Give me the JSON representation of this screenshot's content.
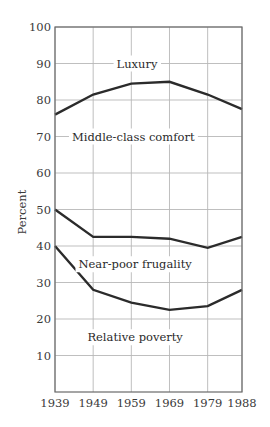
{
  "chart_data": {
    "type": "line",
    "title": "",
    "xlabel": "",
    "ylabel": "Percent",
    "x": [
      1939,
      1949,
      1959,
      1969,
      1979,
      1988
    ],
    "x_tick_labels": [
      "1939",
      "1949",
      "1959",
      "1969",
      "1979",
      "1988"
    ],
    "ylim": [
      0,
      100
    ],
    "y_ticks": [
      10,
      20,
      30,
      40,
      50,
      60,
      70,
      80,
      90,
      100
    ],
    "y_tick_labels": [
      "10",
      "20",
      "30",
      "40",
      "50",
      "60",
      "70",
      "80",
      "90",
      "100"
    ],
    "grid": true,
    "series": [
      {
        "name": "Middle-class comfort / Luxury boundary",
        "values": [
          76,
          81.5,
          84.5,
          85,
          81.5,
          77.5
        ]
      },
      {
        "name": "Near-poor frugality / Middle-class comfort boundary",
        "values": [
          50,
          42.5,
          42.5,
          42,
          39.5,
          42.5
        ]
      },
      {
        "name": "Relative poverty / Near-poor frugality boundary",
        "values": [
          40,
          28,
          24.5,
          22.5,
          23.5,
          28
        ]
      }
    ],
    "annotations": [
      {
        "text": "Luxury",
        "x": 1960.5,
        "y": 90
      },
      {
        "text": "Middle-class comfort",
        "x": 1959.5,
        "y": 70
      },
      {
        "text": "Near-poor frugality",
        "x": 1960,
        "y": 35
      },
      {
        "text": "Relative poverty",
        "x": 1960,
        "y": 15
      }
    ]
  }
}
